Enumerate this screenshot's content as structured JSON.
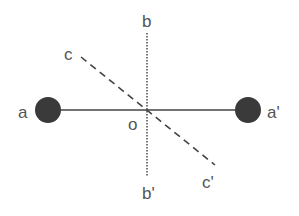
{
  "diagram": {
    "colors": {
      "line": "#444444",
      "atom": "#3a3a3a",
      "text": "#555555"
    },
    "atoms": [
      {
        "id": "a",
        "label": "a",
        "cx": 48,
        "cy": 110,
        "r": 13
      },
      {
        "id": "a_prime",
        "label": "a'",
        "cx": 248,
        "cy": 110,
        "r": 13
      }
    ],
    "axes": [
      {
        "id": "a-a'",
        "style": "solid",
        "x1": 48,
        "y1": 110,
        "x2": 248,
        "y2": 110
      },
      {
        "id": "b-b'",
        "style": "dotted",
        "x1": 147,
        "y1": 33,
        "x2": 147,
        "y2": 177
      },
      {
        "id": "c-c'",
        "style": "dashed",
        "x1": 81,
        "y1": 57,
        "x2": 215,
        "y2": 165
      }
    ],
    "labels": {
      "a": "a",
      "a_prime": "a'",
      "b": "b",
      "b_prime": "b'",
      "c": "c",
      "c_prime": "c'",
      "o": "o"
    }
  }
}
